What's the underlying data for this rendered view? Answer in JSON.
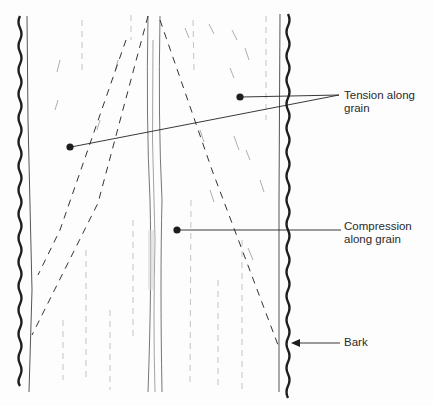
{
  "diagram": {
    "labels": {
      "tension_line1": "Tension along",
      "tension_line2": "grain",
      "compression_line1": "Compression",
      "compression_line2": "along grain",
      "bark": "Bark"
    },
    "colors": {
      "ink": "#1e1e1e",
      "faint_ink": "#9a9a9a",
      "background": "#fdfdfd"
    }
  }
}
